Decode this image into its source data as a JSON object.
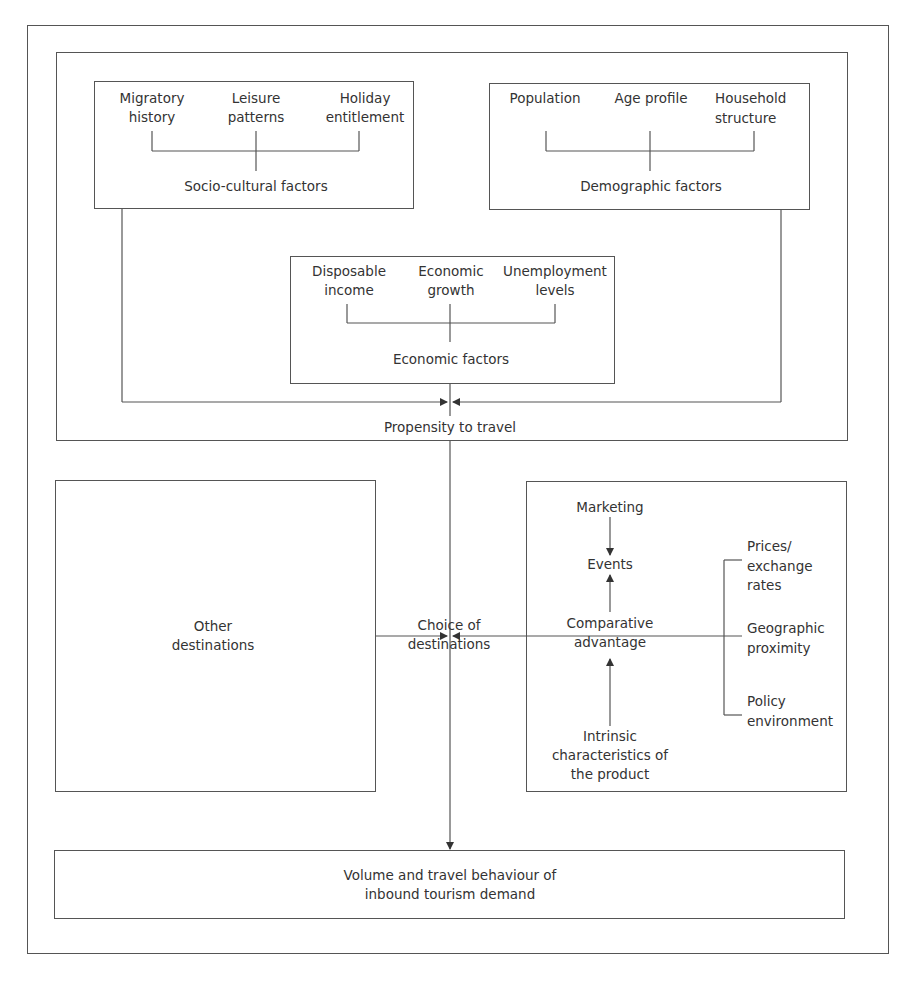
{
  "diagram": {
    "socio_cultural": {
      "items": [
        {
          "line1": "Migratory",
          "line2": "history"
        },
        {
          "line1": "Leisure",
          "line2": "patterns"
        },
        {
          "line1": "Holiday",
          "line2": "entitlement"
        }
      ],
      "label": "Socio-cultural factors"
    },
    "demographic": {
      "items": [
        {
          "line1": "Population",
          "line2": ""
        },
        {
          "line1": "Age profile",
          "line2": ""
        },
        {
          "line1": "Household",
          "line2": "structure"
        }
      ],
      "label": "Demographic factors"
    },
    "economic": {
      "items": [
        {
          "line1": "Disposable",
          "line2": "income"
        },
        {
          "line1": "Economic",
          "line2": "growth"
        },
        {
          "line1": "Unemployment",
          "line2": "levels"
        }
      ],
      "label": "Economic factors"
    },
    "propensity": "Propensity to travel",
    "other_destinations": {
      "line1": "Other",
      "line2": "destinations"
    },
    "choice": {
      "line1": "Choice of",
      "line2": "destinations"
    },
    "destination_factors": {
      "marketing": "Marketing",
      "events": "Events",
      "comparative": {
        "line1": "Comparative",
        "line2": "advantage"
      },
      "intrinsic": {
        "line1": "Intrinsic",
        "line2": "characteristics of",
        "line3": "the product"
      },
      "prices": {
        "line1": "Prices/",
        "line2": "exchange",
        "line3": "rates"
      },
      "geographic": {
        "line1": "Geographic",
        "line2": "proximity"
      },
      "policy": {
        "line1": "Policy",
        "line2": "environment"
      }
    },
    "outcome": {
      "line1": "Volume and travel behaviour of",
      "line2": "inbound tourism demand"
    },
    "colors": {
      "line": "#555555",
      "text": "#333333",
      "background": "#ffffff"
    }
  }
}
